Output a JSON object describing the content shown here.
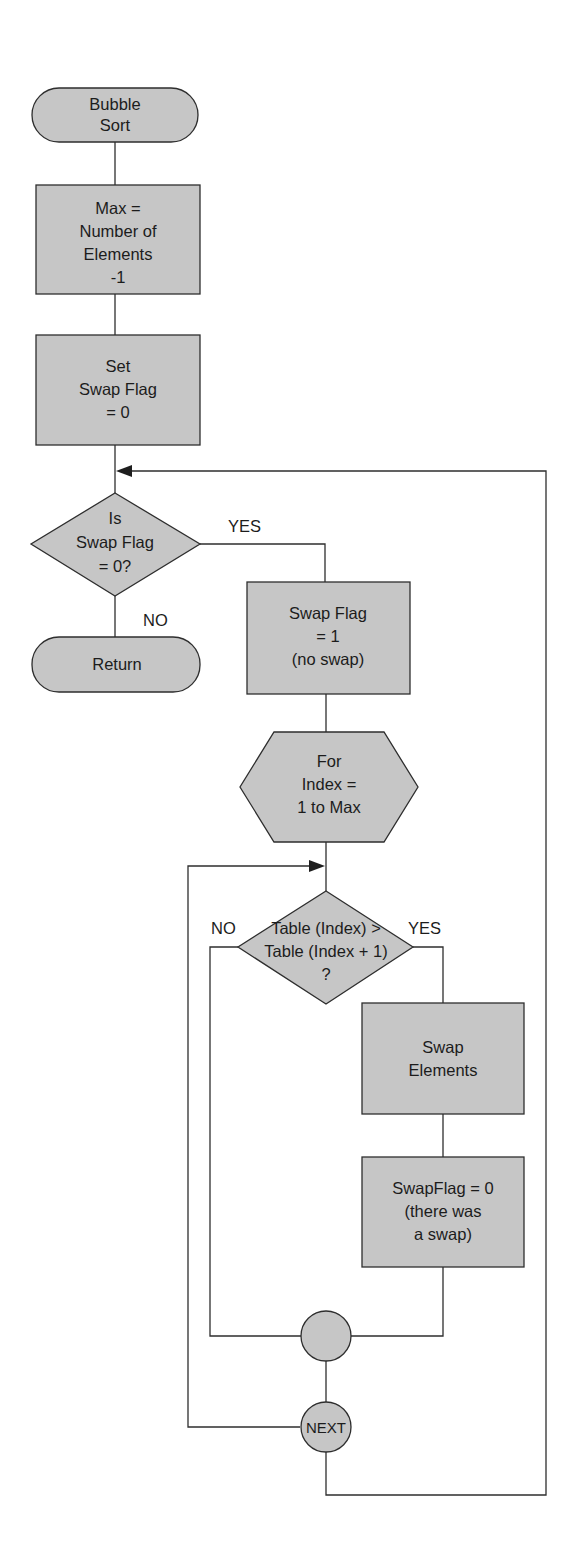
{
  "nodes": {
    "start": {
      "lines": [
        "Bubble",
        "Sort"
      ]
    },
    "set_max": {
      "lines": [
        "Max =",
        "Number of",
        "Elements",
        "-1"
      ]
    },
    "set_flag": {
      "lines": [
        "Set",
        "Swap Flag",
        "= 0"
      ]
    },
    "check_flag": {
      "lines": [
        "Is",
        "Swap Flag",
        "= 0?"
      ]
    },
    "return": {
      "lines": [
        "Return"
      ]
    },
    "flag_one": {
      "lines": [
        "Swap Flag",
        "= 1",
        "(no swap)"
      ]
    },
    "for_loop": {
      "lines": [
        "For",
        "Index =",
        "1 to Max"
      ]
    },
    "compare": {
      "lines": [
        "Table (Index) >",
        "Table (Index + 1)",
        "?"
      ]
    },
    "swap": {
      "lines": [
        "Swap",
        "Elements"
      ]
    },
    "flag_zero": {
      "lines": [
        "SwapFlag = 0",
        "(there was",
        "a swap)"
      ]
    },
    "join": {
      "lines": []
    },
    "next": {
      "lines": [
        "NEXT"
      ]
    }
  },
  "edges": {
    "check_yes": "YES",
    "check_no": "NO",
    "compare_no": "NO",
    "compare_yes": "YES"
  },
  "colors": {
    "fill": "#c6c6c6",
    "stroke": "#2e2e2e",
    "background": "#ffffff"
  }
}
